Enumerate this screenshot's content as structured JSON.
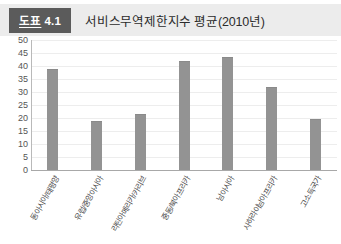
{
  "header": {
    "badge_word": "도표",
    "badge_number": "4.1",
    "title": "서비스무역제한지수 평균(2010년)"
  },
  "colors": {
    "badge_bg": "#5b5b5b",
    "header_bg": "#ececec",
    "bar": "#939393",
    "gridline": "#ededed",
    "axis": "#a8a8a8"
  },
  "chart_data": {
    "type": "bar",
    "title": "서비스무역제한지수 평균(2010년)",
    "xlabel": "",
    "ylabel": "",
    "ylim": [
      0,
      50
    ],
    "yticks": [
      "50",
      "45",
      "40",
      "35",
      "30",
      "25",
      "20",
      "15",
      "10",
      "5",
      "0"
    ],
    "grid": true,
    "legend": false,
    "categories": [
      "동아시아/태평양",
      "유럽/중앙아시아",
      "라틴아메리카/카리브",
      "중동/북아프리카",
      "남아시아",
      "사하라이남아프리카",
      "고소득국가"
    ],
    "values": [
      39,
      19,
      21.5,
      42,
      43.5,
      32,
      19.5
    ]
  }
}
